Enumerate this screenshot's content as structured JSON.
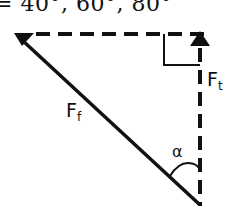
{
  "header": {
    "text": "= 40°, 60°, 80°"
  },
  "diagram": {
    "type": "force-vector-triangle",
    "vectors": [
      {
        "name": "friction-force",
        "label": "F",
        "subscript": "f",
        "style": "solid",
        "direction": "to-top-left"
      },
      {
        "name": "tangential-force",
        "label": "F",
        "subscript": "t",
        "style": "dashed",
        "direction": "up"
      },
      {
        "name": "horizontal-component",
        "label": "",
        "style": "dashed",
        "direction": "left"
      }
    ],
    "angle_label": "α",
    "right_angle_marker": true,
    "colors": {
      "stroke": "#111111",
      "background": "#ffffff"
    }
  }
}
